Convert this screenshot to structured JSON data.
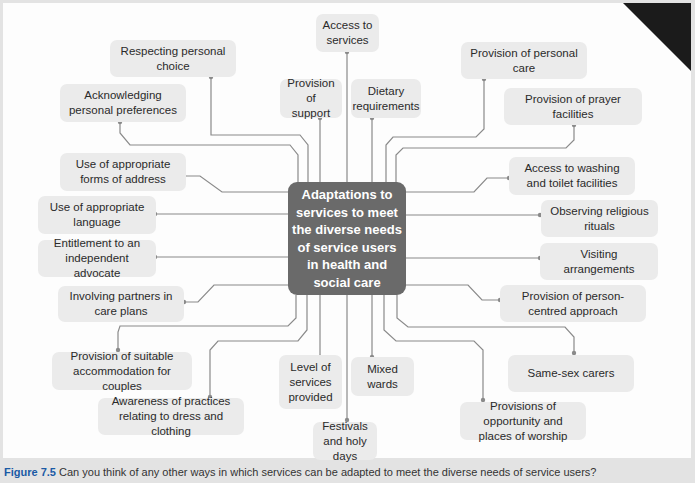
{
  "center": {
    "label": "Adaptations to services to meet the diverse needs of service users in health and social care"
  },
  "nodes": [
    {
      "id": "access-to-services",
      "label": "Access to services"
    },
    {
      "id": "respecting-personal-choice",
      "label": "Respecting personal choice"
    },
    {
      "id": "acknowledging-personal-preferences",
      "label": "Acknowledging personal preferences"
    },
    {
      "id": "provision-of-support",
      "label": "Provision of support"
    },
    {
      "id": "dietary-requirements",
      "label": "Dietary requirements"
    },
    {
      "id": "provision-of-personal-care",
      "label": "Provision of personal care"
    },
    {
      "id": "provision-of-prayer-facilities",
      "label": "Provision of prayer facilities"
    },
    {
      "id": "use-of-appropriate-forms-of-address",
      "label": "Use of appropriate forms of address"
    },
    {
      "id": "access-to-washing-and-toilet-facilities",
      "label": "Access to washing and toilet facilities"
    },
    {
      "id": "use-of-appropriate-language",
      "label": "Use of appropriate language"
    },
    {
      "id": "observing-religious-rituals",
      "label": "Observing religious rituals"
    },
    {
      "id": "entitlement-to-independent-advocate",
      "label": "Entitlement to an independent advocate"
    },
    {
      "id": "visiting-arrangements",
      "label": "Visiting arrangements"
    },
    {
      "id": "involving-partners-in-care-plans",
      "label": "Involving partners in care plans"
    },
    {
      "id": "provision-of-person-centred-approach",
      "label": "Provision of person-centred approach"
    },
    {
      "id": "provision-of-suitable-accommodation",
      "label": "Provision of suitable accommodation for couples"
    },
    {
      "id": "level-of-services-provided",
      "label": "Level of services provided"
    },
    {
      "id": "mixed-wards",
      "label": "Mixed wards"
    },
    {
      "id": "same-sex-carers",
      "label": "Same-sex carers"
    },
    {
      "id": "awareness-of-practices-dress",
      "label": "Awareness of practices relating to dress and clothing"
    },
    {
      "id": "provisions-of-opportunity-worship",
      "label": "Provisions of opportunity and places of worship"
    },
    {
      "id": "festivals-and-holy-days",
      "label": "Festivals and holy days"
    }
  ],
  "caption": {
    "figure_label": "Figure 7.5",
    "text": "Can you think of any other ways in which services can be adapted to meet the diverse needs of service users?"
  },
  "colors": {
    "center_fill": "#6a6a6a",
    "node_fill": "#ebebeb",
    "line": "#8a8a8a",
    "figure_label": "#1a5aa5"
  }
}
